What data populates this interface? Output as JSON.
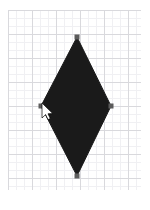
{
  "app": {
    "title": "Shape Canvas",
    "canvas_label": "drawing-canvas"
  },
  "canvas": {
    "width": 150,
    "height": 210,
    "background_color": "#ffffff",
    "grid": {
      "enabled": true,
      "minor_spacing_px": 8,
      "major_spacing_px": 24,
      "minor_color": "#f0f0f3",
      "major_color": "#d9d9dd",
      "origin_x": 8,
      "origin_y": 10,
      "grid_width": 133,
      "grid_height": 180
    }
  },
  "shape": {
    "name": "diamond",
    "type": "polygon",
    "fill_color": "#1a1a1a",
    "stroke_color": "#1a1a1a",
    "selected": true,
    "points": [
      {
        "label": "top",
        "x": 77,
        "y": 37
      },
      {
        "label": "right",
        "x": 111,
        "y": 106
      },
      {
        "label": "bottom",
        "x": 77,
        "y": 176
      },
      {
        "label": "left",
        "x": 41,
        "y": 106
      }
    ],
    "bounds": {
      "x": 41,
      "y": 37,
      "width": 70,
      "height": 139
    },
    "center": {
      "x": 76,
      "y": 106
    }
  },
  "handles": {
    "color": "#5c5c5c",
    "size": 5,
    "points": [
      {
        "label": "handle-top",
        "x": 77,
        "y": 37
      },
      {
        "label": "handle-right",
        "x": 111,
        "y": 106
      },
      {
        "label": "handle-bottom",
        "x": 77,
        "y": 176
      },
      {
        "label": "handle-left",
        "x": 41,
        "y": 106
      }
    ]
  },
  "cursor": {
    "kind": "arrow-pointer",
    "x": 42,
    "y": 103,
    "fill_color": "#ffffff",
    "outline_color": "#000000"
  }
}
